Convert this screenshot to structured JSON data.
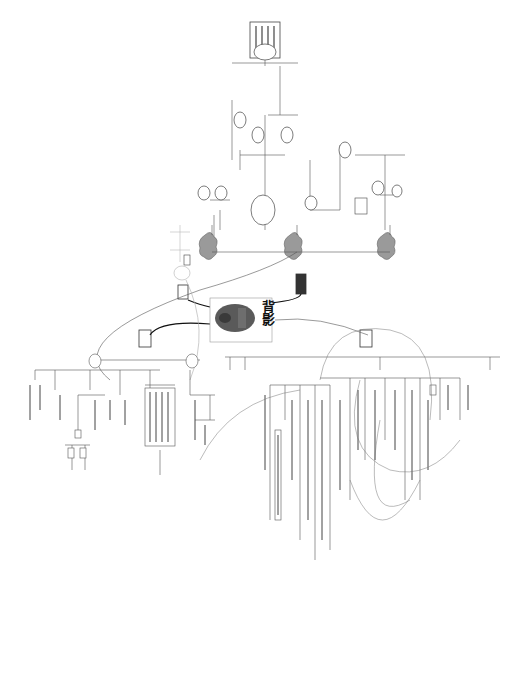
{
  "mindmap": {
    "central_topic": "背影",
    "central_image": "father-back-portrait",
    "orientation": "rotated-90",
    "colors": {
      "background": "#ffffff",
      "line": "#555555",
      "cloud_fill": "#9a9a9a",
      "box_stroke": "#444444",
      "faded_line": "#bbbbbb"
    },
    "main_branches": [
      {
        "id": "upper-left",
        "shape": "box",
        "label": ""
      },
      {
        "id": "upper-right",
        "shape": "box",
        "label": ""
      },
      {
        "id": "lower-left",
        "shape": "box",
        "label": ""
      },
      {
        "id": "lower-right",
        "shape": "box",
        "label": ""
      }
    ],
    "cloud_nodes": [
      {
        "id": "cloud-1",
        "label": ""
      },
      {
        "id": "cloud-2",
        "label": ""
      },
      {
        "id": "cloud-3",
        "label": ""
      }
    ]
  }
}
